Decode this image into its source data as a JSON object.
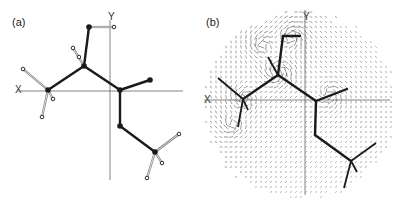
{
  "figure": {
    "panels": [
      {
        "id": "a",
        "label": "(a)",
        "label_pos": [
          12,
          26
        ],
        "axes": {
          "x_label": "X",
          "x_label_pos": [
            15,
            93
          ],
          "y_label": "Y",
          "y_label_pos": [
            108,
            20
          ],
          "x_line": [
            17,
            91,
            183,
            91
          ],
          "y_line": [
            110,
            20,
            110,
            180
          ]
        },
        "bonds": [
          [
            48,
            90,
            84,
            66
          ],
          [
            84,
            66,
            89,
            27
          ],
          [
            84,
            66,
            120,
            90
          ],
          [
            120,
            90,
            150,
            80
          ],
          [
            120,
            90,
            120,
            126
          ],
          [
            120,
            126,
            155,
            152
          ]
        ],
        "h_bonds": [
          [
            48,
            90,
            23,
            69
          ],
          [
            48,
            90,
            53,
            99
          ],
          [
            48,
            90,
            42,
            117
          ],
          [
            84,
            66,
            73,
            48
          ],
          [
            89,
            27,
            114,
            27
          ],
          [
            155,
            152,
            179,
            134
          ],
          [
            155,
            152,
            162,
            163
          ],
          [
            155,
            152,
            147,
            178
          ]
        ],
        "heavy_atoms": [
          [
            48,
            90
          ],
          [
            84,
            66
          ],
          [
            89,
            27
          ],
          [
            120,
            90
          ],
          [
            150,
            80
          ],
          [
            120,
            126
          ],
          [
            155,
            152
          ]
        ],
        "h_atoms": [
          [
            23,
            69
          ],
          [
            53,
            99
          ],
          [
            42,
            117
          ],
          [
            73,
            48
          ],
          [
            79,
            57
          ],
          [
            114,
            27
          ],
          [
            179,
            134
          ],
          [
            162,
            163
          ],
          [
            147,
            178
          ]
        ]
      },
      {
        "id": "b",
        "label": "(b)",
        "label_pos": [
          206,
          26
        ],
        "axes": {
          "x_label": "X",
          "x_label_pos": [
            204,
            103
          ],
          "y_label": "Y",
          "y_label_pos": [
            303,
            20
          ],
          "x_line": [
            204,
            100,
            390,
            100
          ],
          "y_line": [
            305,
            10,
            305,
            195
          ]
        },
        "bonds": [
          [
            243,
            99,
            278,
            75
          ],
          [
            278,
            75,
            283,
            36
          ],
          [
            283,
            36,
            300,
            36
          ],
          [
            278,
            75,
            316,
            101
          ],
          [
            316,
            101,
            347,
            89
          ],
          [
            316,
            101,
            315,
            135
          ],
          [
            315,
            135,
            351,
            161
          ]
        ],
        "h_bonds": [
          [
            243,
            99,
            218,
            78
          ],
          [
            243,
            99,
            248,
            110
          ],
          [
            243,
            99,
            238,
            127
          ],
          [
            278,
            75,
            268,
            57
          ],
          [
            351,
            161,
            376,
            143
          ],
          [
            351,
            161,
            357,
            172
          ],
          [
            351,
            161,
            344,
            188
          ]
        ],
        "vector_field": {
          "description": "dense arrow field around molecule, swirling near atoms",
          "grid_step": 5,
          "region_center": [
            300,
            105
          ],
          "region_radius_x": 92,
          "region_radius_y": 90,
          "sources": [
            [
              278,
              72,
              1.0
            ],
            [
              243,
              99,
              0.7
            ],
            [
              292,
              36,
              0.8
            ],
            [
              330,
              95,
              0.6
            ],
            [
              233,
              125,
              0.5
            ],
            [
              262,
              45,
              0.6
            ]
          ]
        }
      }
    ],
    "colors": {
      "bond": "#1a1a1a",
      "axis": "#666666",
      "h_bond": "#777777",
      "field": "#555555"
    }
  }
}
